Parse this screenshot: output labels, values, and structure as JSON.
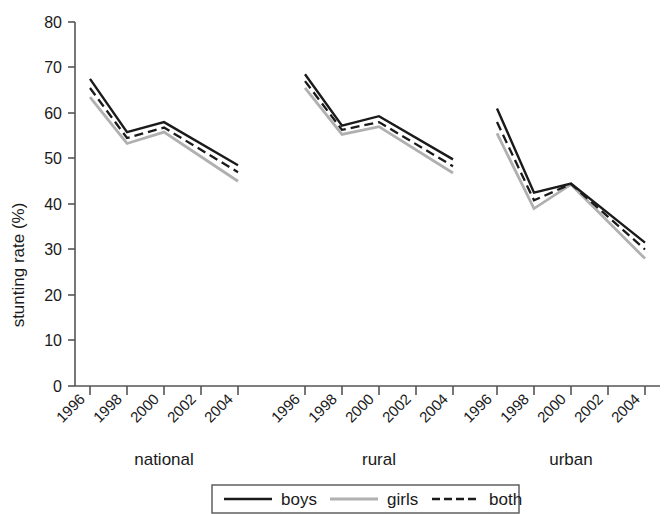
{
  "chart_data": {
    "type": "line",
    "title": "",
    "xlabel": "",
    "ylabel": "stunting rate (%)",
    "ylim": [
      0,
      80
    ],
    "yticks": [
      0,
      10,
      20,
      30,
      40,
      50,
      60,
      70,
      80
    ],
    "grid": false,
    "legend_position": "bottom-outside",
    "panels": [
      {
        "name": "national",
        "x": [
          1996,
          1998,
          2000,
          2004
        ],
        "xtick_labels": [
          "1996",
          "1998",
          "2000",
          "2002",
          "2004"
        ],
        "series": [
          {
            "name": "boys",
            "values": [
              67.5,
              55.8,
              58.0,
              48.5
            ]
          },
          {
            "name": "girls",
            "values": [
              63.5,
              53.3,
              55.8,
              45.0
            ]
          },
          {
            "name": "both",
            "values": [
              65.5,
              54.5,
              56.8,
              47.0
            ]
          }
        ]
      },
      {
        "name": "rural",
        "x": [
          1996,
          1998,
          2000,
          2004
        ],
        "xtick_labels": [
          "1996",
          "1998",
          "2000",
          "2002",
          "2004"
        ],
        "series": [
          {
            "name": "boys",
            "values": [
              68.5,
              57.2,
              59.3,
              49.8
            ]
          },
          {
            "name": "girls",
            "values": [
              65.5,
              55.3,
              57.0,
              46.8
            ]
          },
          {
            "name": "both",
            "values": [
              67.0,
              56.3,
              58.0,
              48.3
            ]
          }
        ]
      },
      {
        "name": "urban",
        "x": [
          1996,
          1998,
          2000,
          2004
        ],
        "xtick_labels": [
          "1996",
          "1998",
          "2000",
          "2002",
          "2004"
        ],
        "series": [
          {
            "name": "boys",
            "values": [
              61.0,
              42.5,
              44.5,
              31.5
            ]
          },
          {
            "name": "girls",
            "values": [
              55.5,
              39.0,
              44.3,
              28.0
            ]
          },
          {
            "name": "both",
            "values": [
              58.0,
              40.8,
              44.4,
              30.0
            ]
          }
        ]
      }
    ],
    "legend": [
      {
        "label": "boys",
        "style": "solid",
        "color": "#1a1a1a"
      },
      {
        "label": "girls",
        "style": "solid",
        "color": "#b0b0b0"
      },
      {
        "label": "both",
        "style": "dashed",
        "color": "#1a1a1a"
      }
    ]
  },
  "axis": {
    "y_title": "stunting rate (%)",
    "y_tick_labels": [
      "80",
      "70",
      "60",
      "50",
      "40",
      "30",
      "20",
      "10",
      "0"
    ]
  },
  "groups": {
    "national_label": "national",
    "rural_label": "rural",
    "urban_label": "urban"
  },
  "xticks": {
    "t1996": "1996",
    "t1998": "1998",
    "t2000": "2000",
    "t2002": "2002",
    "t2004": "2004"
  },
  "legend": {
    "boys_label": "boys",
    "girls_label": "girls",
    "both_label": "both"
  }
}
